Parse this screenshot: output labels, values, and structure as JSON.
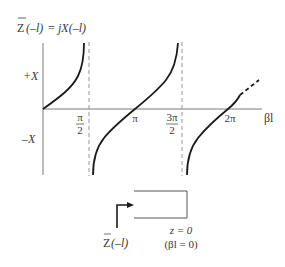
{
  "diagram": {
    "title": {
      "prefix": "Z",
      "lhs_arg": "(–l)",
      "equals": " = ",
      "rhs": "jX(–l)"
    },
    "y_axis": {
      "pos_label": "+X",
      "neg_label": "–X"
    },
    "x_axis": {
      "label": "βl",
      "ticks": [
        {
          "num": "π",
          "den": "2",
          "value": "π/2"
        },
        {
          "num": "π",
          "den": "",
          "value": "π"
        },
        {
          "num": "3π",
          "den": "2",
          "value": "3π/2"
        },
        {
          "num": "2π",
          "den": "",
          "value": "2π"
        }
      ]
    },
    "curve": {
      "function": "X = tan(βl)",
      "asymptotes": [
        "π/2",
        "3π/2"
      ],
      "note": "dashed continuation beyond 2π"
    },
    "line_sketch": {
      "input_label_prefix": "Z",
      "input_label_arg": "(–l)",
      "load_label_1": "z = 0",
      "load_label_2": "(βl = 0)",
      "termination": "short circuit"
    },
    "colors": {
      "curve": "#1a1a1a",
      "axis": "#7a7a7a",
      "asymptote": "#8a8a8a",
      "text": "#3a3a3a"
    }
  }
}
